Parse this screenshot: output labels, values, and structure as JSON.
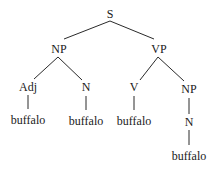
{
  "tree": {
    "root": "S",
    "nodes": {
      "s": "S",
      "np1": "NP",
      "vp": "VP",
      "adj": "Adj",
      "n1": "N",
      "v": "V",
      "np2": "NP",
      "n2": "N"
    },
    "leaves": {
      "adj_word": "buffalo",
      "n1_word": "buffalo",
      "v_word": "buffalo",
      "n2_word": "buffalo"
    }
  }
}
